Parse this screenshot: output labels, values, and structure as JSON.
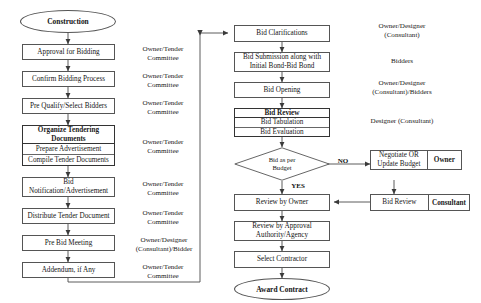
{
  "diagram": {
    "left_column": {
      "start": {
        "label": "Construction"
      },
      "nodes": [
        {
          "label": "Approval for Bidding"
        },
        {
          "label": "Confirm Bidding Process"
        },
        {
          "label": "Pre Qualify/Select Bidders"
        },
        {
          "label": "Bid\nNotification/Advertisement"
        },
        {
          "label": "Distribute Tender Document"
        },
        {
          "label": "Pre Bid Meeting"
        },
        {
          "label": "Addendum, if Any"
        }
      ],
      "stack": {
        "head": "Organize Tendering Documents",
        "rows": [
          "Prepare Advertisement",
          "Compile Tender Documents"
        ]
      },
      "responsibilities": [
        "Owner/Tender\nCommittee",
        "Owner/Tender\nCommittee",
        "Owner/Tender\nCommittee",
        "Owner/Tender\nCommittee",
        "Owner/Tender\nCommittee",
        "Owner/Tender\nCommittee",
        "Owner/Designer\n(Consultant)/Bidder",
        "Owner/Tender\nCommittee"
      ]
    },
    "right_column": {
      "nodes": [
        {
          "label": "Bid Clarifications"
        },
        {
          "label": "Bid Submission along with\nInitial Bond-Bid Bond"
        },
        {
          "label": "Bid Opening"
        },
        {
          "label": "Review by Owner"
        },
        {
          "label": "Review by Approval\nAuthority/Agency"
        },
        {
          "label": "Select Contractor"
        }
      ],
      "stack": {
        "head": "Bid Review",
        "rows": [
          "Bid Tabulation",
          "Bid Evaluation"
        ]
      },
      "decision": {
        "label": "Bid as per\nBudget"
      },
      "branch_labels": {
        "no": "NO",
        "yes": "YES"
      },
      "side_pairs": [
        {
          "action": "Negotiate OR\nUpdate Budget",
          "actor": "Owner"
        },
        {
          "action": "Bid Review",
          "actor": "Consultant"
        }
      ],
      "end": {
        "label": "Award Contract"
      },
      "responsibilities": [
        "Owner/Designer\n(Consultant)",
        "Bidders",
        "Owner/Designer\n(Consultant)/Bidders",
        "Designer (Consultant)"
      ]
    },
    "colors": {
      "background": "#ffffff",
      "stroke": "#555555",
      "emphasis_stroke": "#333333",
      "text": "#141414"
    }
  }
}
